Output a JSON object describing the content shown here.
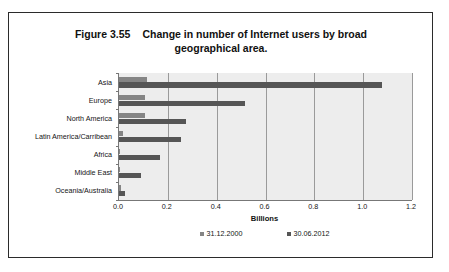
{
  "figure": {
    "number": "Figure 3.55",
    "caption_line1": "Change in number of Internet users by broad",
    "caption_line2": "geographical area."
  },
  "chart_data": {
    "type": "bar",
    "orientation": "horizontal",
    "xlabel": "Billions",
    "ylabel": "",
    "xlim": [
      0,
      1.2
    ],
    "xticks": [
      "0.0",
      "0.2",
      "0.4",
      "0.6",
      "0.8",
      "1.0",
      "1.2"
    ],
    "xtick_values": [
      0,
      0.2,
      0.4,
      0.6,
      0.8,
      1.0,
      1.2
    ],
    "grid": true,
    "grid_axis": "x",
    "legend_position": "bottom",
    "categories": [
      "Asia",
      "Europe",
      "North America",
      "Latin America/Carribean",
      "Africa",
      "Middle East",
      "Oceania/Australia"
    ],
    "series": [
      {
        "name": "31.12.2000",
        "color": "#858585",
        "values": [
          0.115,
          0.105,
          0.108,
          0.018,
          0.004,
          0.003,
          0.008
        ]
      },
      {
        "name": "30.06.2012",
        "color": "#565656",
        "values": [
          1.076,
          0.518,
          0.274,
          0.255,
          0.167,
          0.09,
          0.024
        ]
      }
    ]
  },
  "legend": {
    "entries": [
      {
        "label": "31.12.2000",
        "color": "#858585"
      },
      {
        "label": "30.06.2012",
        "color": "#565656"
      }
    ]
  },
  "axis": {
    "x_title": "Billions"
  },
  "colors": {
    "frame_border": "#2b2b2b",
    "plot_background": "#ededed",
    "gridline": "#9a9a9a",
    "axis_line": "#777777",
    "series_2000": "#858585",
    "series_2012": "#565656",
    "text": "#151515"
  }
}
